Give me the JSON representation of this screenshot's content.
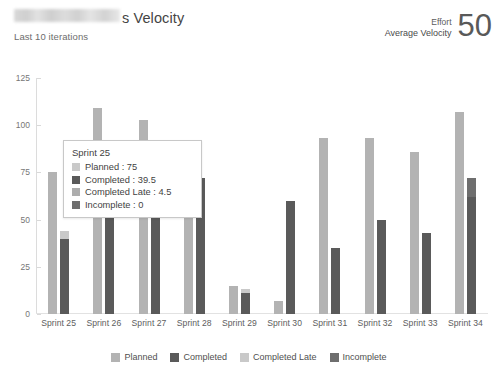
{
  "header": {
    "title_redacted": true,
    "title_visible_text": "s Velocity",
    "subtitle": "Last 10 iterations",
    "kpi": {
      "effort_label": "Effort",
      "metric_label": "Average Velocity",
      "value": "50"
    }
  },
  "colors": {
    "planned": "#b3b3b3",
    "completed": "#5a5a5a",
    "completed_late": "#c9c9c9",
    "incomplete": "#6e6e6e",
    "axis": "#dcdcdc",
    "text": "#5d5d5d"
  },
  "legend": {
    "items": [
      {
        "label": "Planned",
        "color": "#b3b3b3"
      },
      {
        "label": "Completed",
        "color": "#5a5a5a"
      },
      {
        "label": "Completed Late",
        "color": "#c9c9c9"
      },
      {
        "label": "Incomplete",
        "color": "#6e6e6e"
      }
    ]
  },
  "tooltip": {
    "title": "Sprint 25",
    "rows": [
      {
        "label": "Planned : 75",
        "color": "#c9c9c9"
      },
      {
        "label": "Completed : 39.5",
        "color": "#5a5a5a"
      },
      {
        "label": "Completed Late : 4.5",
        "color": "#adadad"
      },
      {
        "label": "Incomplete : 0",
        "color": "#6e6e6e"
      }
    ]
  },
  "chart_data": {
    "type": "bar",
    "title": "s Velocity",
    "subtitle": "Last 10 iterations",
    "xlabel": "",
    "ylabel": "",
    "ylim": [
      0,
      125
    ],
    "yticks": [
      0,
      25,
      50,
      75,
      100,
      125
    ],
    "grid": false,
    "legend_position": "bottom",
    "categories": [
      "Sprint 25",
      "Sprint 26",
      "Sprint 27",
      "Sprint 28",
      "Sprint 29",
      "Sprint 30",
      "Sprint 31",
      "Sprint 32",
      "Sprint 33",
      "Sprint 34"
    ],
    "series": [
      {
        "name": "Planned",
        "color": "#b3b3b3",
        "stack": "planned",
        "values": [
          75,
          109,
          103,
          92,
          15,
          7,
          93,
          93,
          86,
          107
        ]
      },
      {
        "name": "Completed",
        "color": "#5a5a5a",
        "stack": "actual",
        "values": [
          39.5,
          55,
          55,
          72,
          11,
          60,
          35,
          50,
          43,
          62
        ]
      },
      {
        "name": "Completed Late",
        "color": "#c9c9c9",
        "stack": "actual",
        "values": [
          4.5,
          0,
          0,
          0,
          2,
          0,
          0,
          0,
          0,
          0
        ]
      },
      {
        "name": "Incomplete",
        "color": "#6e6e6e",
        "stack": "actual",
        "values": [
          0,
          0,
          0,
          0,
          0,
          0,
          0,
          0,
          0,
          10
        ]
      }
    ]
  }
}
